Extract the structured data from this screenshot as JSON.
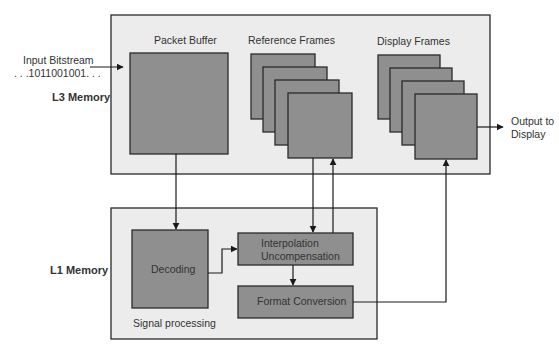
{
  "diagram": {
    "input": {
      "line1": "Input Bitstream",
      "line2": ". . .1011001001. . ."
    },
    "output": {
      "line1": "Output to",
      "line2": "Display"
    },
    "l3": {
      "label": "L3 Memory",
      "packet_buffer": "Packet Buffer",
      "reference_frames": "Reference Frames",
      "display_frames": "Display Frames"
    },
    "l1": {
      "label": "L1 Memory",
      "decoding": "Decoding",
      "interp_line1": "Interpolation",
      "interp_line2": "Uncompensation",
      "format_conversion": "Format Conversion",
      "signal_processing": "Signal processing"
    },
    "colors": {
      "outer_fill": "#ececec",
      "block_fill": "#8f8f8f",
      "stroke": "#2a2a2a"
    }
  }
}
